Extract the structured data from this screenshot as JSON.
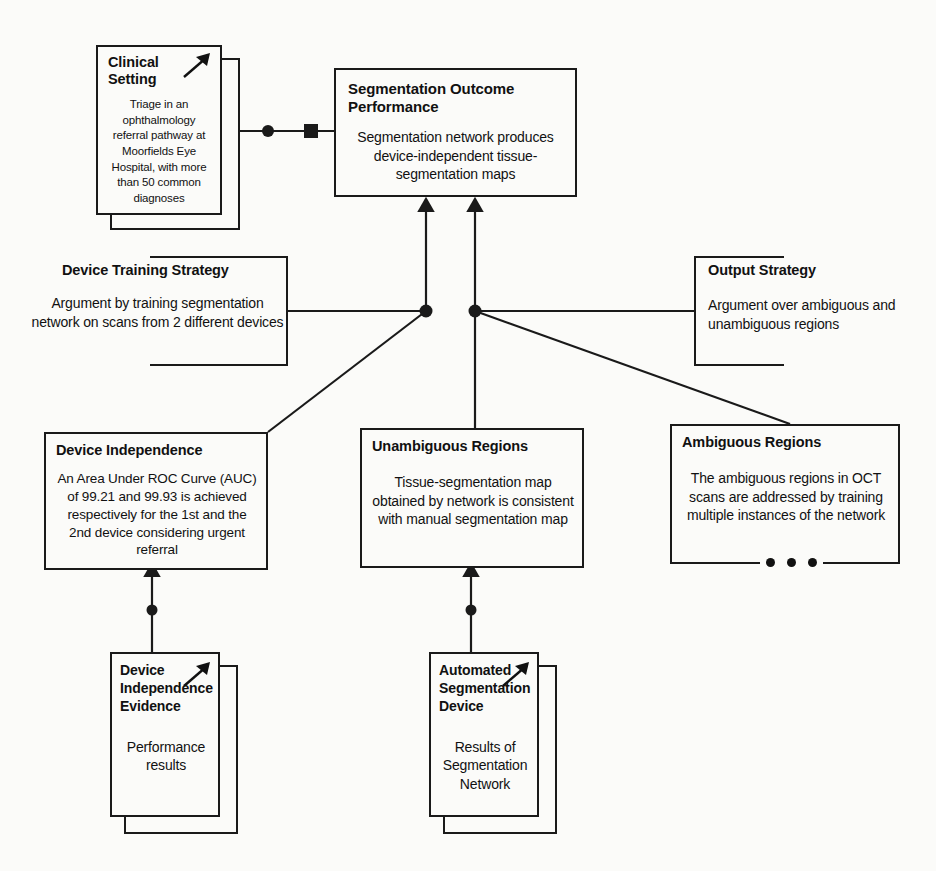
{
  "diagram": {
    "type": "assurance-case-diagram"
  },
  "nodes": {
    "clinical_setting": {
      "title": "Clinical Setting",
      "body": "Triage in an ophthalmology referral pathway at Moorfields Eye Hospital, with more than 50 common diagnoses",
      "shape": "stacked-box",
      "icon": "arrow-up-right-icon"
    },
    "segmentation_outcome": {
      "title": "Segmentation Outcome Performance",
      "body": "Segmentation network produces device-independent tissue-segmentation maps",
      "shape": "box"
    },
    "device_training_strategy": {
      "title": "Device Training Strategy",
      "body": "Argument by training segmentation network on scans from 2 different devices",
      "shape": "bracket-right"
    },
    "output_strategy": {
      "title": "Output Strategy",
      "body": "Argument over ambiguous and unambiguous regions",
      "shape": "bracket-left"
    },
    "device_independence": {
      "title": "Device Independence",
      "body": "An Area Under ROC Curve (AUC) of 99.21 and 99.93 is achieved respectively for the 1st and the 2nd device considering urgent referral",
      "shape": "box"
    },
    "unambiguous_regions": {
      "title": "Unambiguous Regions",
      "body": "Tissue-segmentation map obtained by network is consistent with manual segmentation map",
      "shape": "box"
    },
    "ambiguous_regions": {
      "title": "Ambiguous Regions",
      "body": "The ambiguous regions in OCT scans are addressed by training multiple instances of the network",
      "shape": "box-with-ellipsis",
      "ellipsis": "• • •"
    },
    "device_independence_evidence": {
      "title": "Device Independence Evidence",
      "body": "Performance results",
      "shape": "stacked-box",
      "icon": "arrow-up-right-icon"
    },
    "automated_segmentation_device": {
      "title": "Automated Segmentation Device",
      "body": "Results of Segmentation Network",
      "shape": "stacked-box",
      "icon": "arrow-up-right-icon"
    }
  },
  "connectors": {
    "context_link_label": "context-link",
    "junction_label": "junction-dot",
    "square_label": "filled-square-marker"
  },
  "colors": {
    "ink": "#1a1a1a",
    "paper": "#fbfbf9"
  }
}
